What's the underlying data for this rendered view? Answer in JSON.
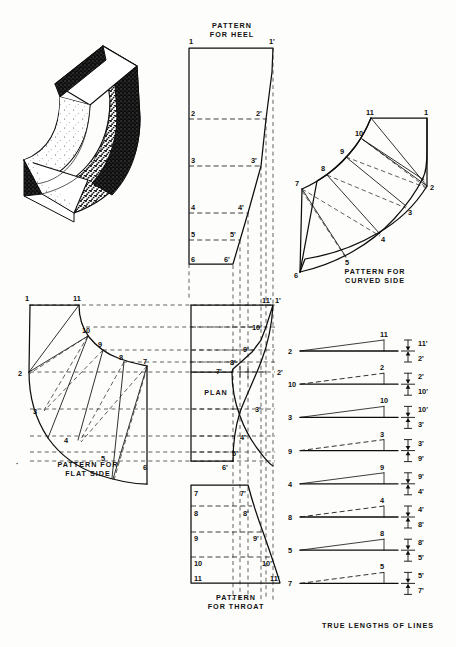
{
  "sheet": {
    "kind": "sheet-metal pattern development plate",
    "width": 456,
    "height": 647,
    "ink_color": "#0d0d0d",
    "paper_color": "#fdfdfb"
  },
  "pictorial": {
    "name": "isometric-elbow",
    "description": "Isometric stipple-shaded rectangular duct elbow (square throat and heel)"
  },
  "captions": {
    "heel": [
      "PATTERN",
      "FOR HEEL"
    ],
    "curved_side": [
      "PATTERN FOR",
      "CURVED SIDE"
    ],
    "flat_side": [
      "PATTERN FOR",
      "FLAT SIDE"
    ],
    "throat": [
      "PATTERN",
      "FOR THROAT"
    ],
    "plan": "PLAN",
    "true_lengths": "TRUE LENGTHS OF LINES"
  },
  "heel_pattern": {
    "left_labels": [
      "1",
      "2",
      "3",
      "4",
      "5",
      "6"
    ],
    "right_labels": [
      "1'",
      "2'",
      "3'",
      "4'",
      "5'",
      "6'"
    ]
  },
  "throat_pattern": {
    "left_labels": [
      "7",
      "8",
      "9",
      "10",
      "11"
    ],
    "right_labels": [
      "7'",
      "8'",
      "9'",
      "10'",
      "11'"
    ]
  },
  "curved_side_pattern": {
    "outer_labels": [
      "11",
      "10",
      "9",
      "8",
      "7"
    ],
    "inner_labels": [
      "1",
      "2",
      "3",
      "4",
      "5",
      "6"
    ]
  },
  "flat_side_pattern": {
    "outer_labels": [
      "11",
      "10",
      "9",
      "8",
      "7"
    ],
    "inner_labels": [
      "1",
      "2",
      "3",
      "4",
      "5",
      "6"
    ]
  },
  "plan_view": {
    "label": "PLAN",
    "labels": [
      "1'",
      "11'",
      "10'",
      "9'",
      "8'",
      "7'",
      "2'",
      "3'",
      "4'",
      "5'",
      "6'"
    ]
  },
  "true_lengths": {
    "title": "TRUE LENGTHS OF LINES",
    "rows": [
      {
        "left": "2",
        "apex": "11",
        "top": "11'",
        "bottom": "2'",
        "style": "solid"
      },
      {
        "left": "10",
        "apex": "2",
        "top": "2'",
        "bottom": "10'",
        "style": "dashed"
      },
      {
        "left": "3",
        "apex": "10",
        "top": "10'",
        "bottom": "3'",
        "style": "solid"
      },
      {
        "left": "9",
        "apex": "3",
        "top": "3'",
        "bottom": "9'",
        "style": "dashed"
      },
      {
        "left": "4",
        "apex": "9",
        "top": "9'",
        "bottom": "4'",
        "style": "solid"
      },
      {
        "left": "8",
        "apex": "4",
        "top": "4'",
        "bottom": "8'",
        "style": "dashed"
      },
      {
        "left": "5",
        "apex": "8",
        "top": "8'",
        "bottom": "5'",
        "style": "solid"
      },
      {
        "left": "7",
        "apex": "5",
        "top": "5'",
        "bottom": "7'",
        "style": "dashed"
      }
    ]
  }
}
